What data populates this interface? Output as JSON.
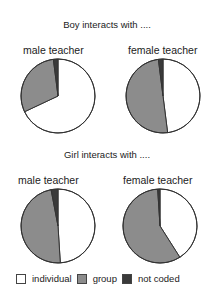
{
  "colors": {
    "individual": "#ffffff",
    "group": "#8c8c8c",
    "not_coded": "#3a3a3a",
    "stroke": "#333333"
  },
  "sections": [
    {
      "title": "Boy interacts with ...."
    },
    {
      "title": "Girl interacts with ...."
    }
  ],
  "pies": [
    {
      "label": "male teacher"
    },
    {
      "label": "female teacher"
    },
    {
      "label": "male teacher"
    },
    {
      "label": "female teacher"
    }
  ],
  "legend": [
    {
      "key": "individual",
      "label": "individual"
    },
    {
      "key": "group",
      "label": "group"
    },
    {
      "key": "not_coded",
      "label": "not coded"
    }
  ],
  "chart_data": [
    {
      "type": "pie",
      "title": "Boy interacts with .... male teacher",
      "categories": [
        "individual",
        "group",
        "not coded"
      ],
      "values": [
        68,
        30,
        2
      ]
    },
    {
      "type": "pie",
      "title": "Boy interacts with .... female teacher",
      "categories": [
        "individual",
        "group",
        "not coded"
      ],
      "values": [
        48,
        50,
        2
      ]
    },
    {
      "type": "pie",
      "title": "Girl interacts with .... male teacher",
      "categories": [
        "individual",
        "group",
        "not coded"
      ],
      "values": [
        49,
        48,
        3
      ]
    },
    {
      "type": "pie",
      "title": "Girl interacts with .... female teacher",
      "categories": [
        "individual",
        "group",
        "not coded"
      ],
      "values": [
        41,
        58,
        1
      ]
    }
  ]
}
